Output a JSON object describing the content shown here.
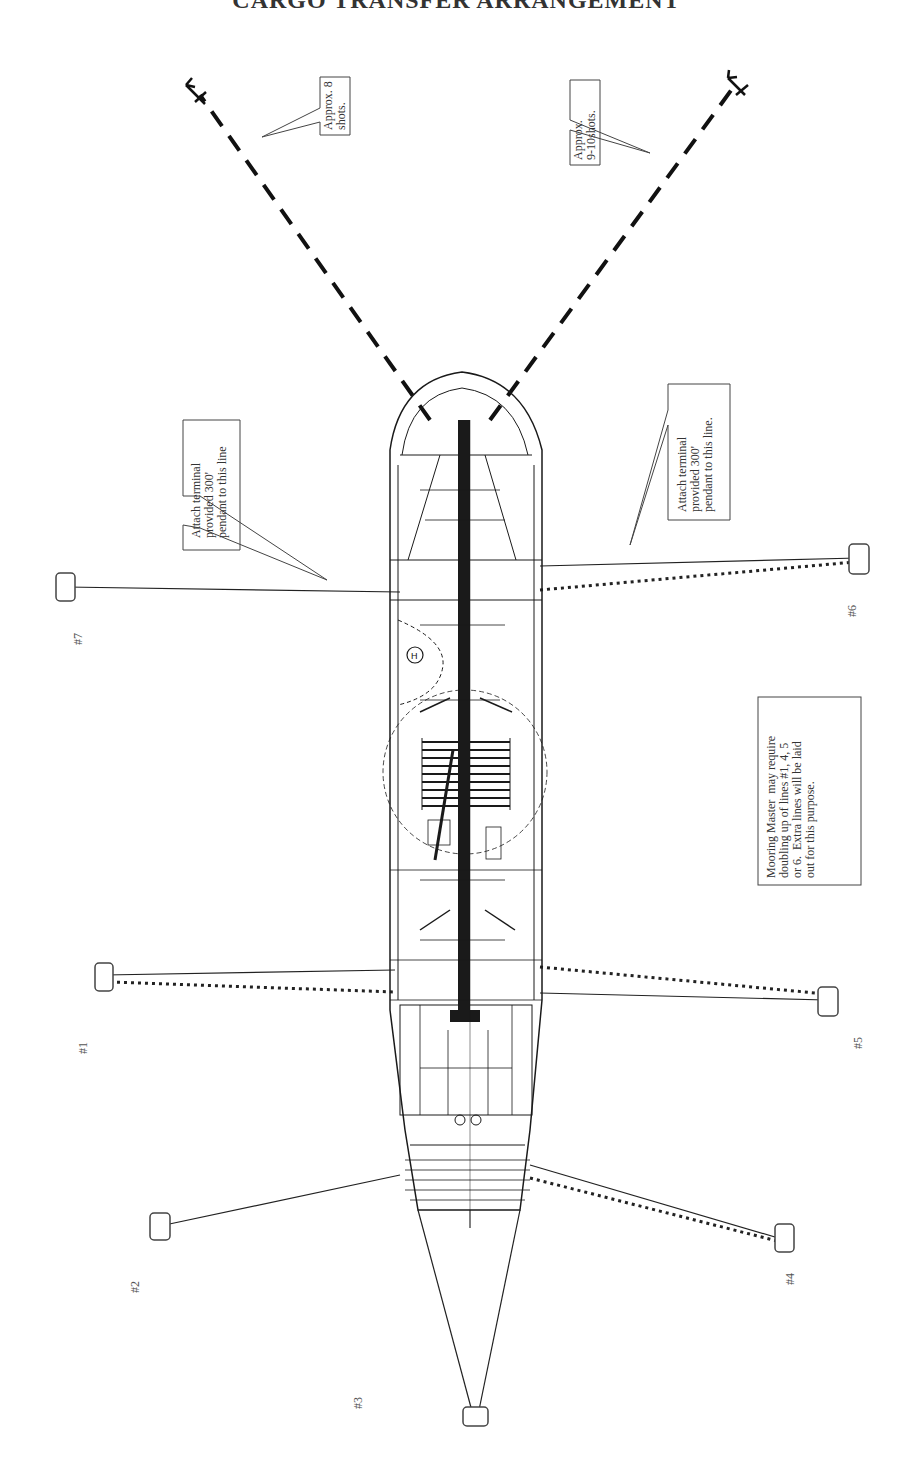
{
  "title": "CARGO TRANSFER ARRANGEMENT",
  "callouts": {
    "anchor_port": "Approx. 8\nshots.",
    "anchor_starboard": "Approx.\n9-10shots.",
    "pendant_port": "Attach terminal\nprovided 300'\npendant to this line",
    "pendant_starboard": "Attach terminal\nprovided 300'\npendant to this line.",
    "mooring_master": "Mooring Master  may require\ndoubling up of lines #1, 4, 5\nor 6.  Extra lines will be laid\nout for this purpose."
  },
  "buoys": [
    {
      "id": "#7",
      "label": "#7"
    },
    {
      "id": "#6",
      "label": "#6"
    },
    {
      "id": "#1",
      "label": "#1"
    },
    {
      "id": "#5",
      "label": "#5"
    },
    {
      "id": "#2",
      "label": "#2"
    },
    {
      "id": "#4",
      "label": "#4"
    },
    {
      "id": "#3",
      "label": "#3"
    }
  ],
  "legend": {
    "solid_line": "mooring line",
    "dotted_line": "doubled mooring line",
    "dashed_line": "anchor chain"
  },
  "colors": {
    "line": "#222222",
    "ship": "#1a1a1a",
    "box_border": "#444444"
  }
}
